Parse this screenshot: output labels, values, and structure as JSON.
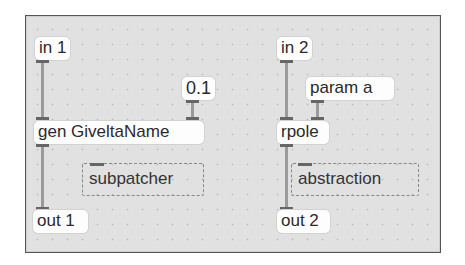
{
  "patcher": {
    "background_color": "#e1e1e1",
    "objects": {
      "in1": {
        "label": "in 1"
      },
      "num": {
        "label": "0.1"
      },
      "gen": {
        "label": "gen GiveltaName"
      },
      "subpatcher": {
        "label": "subpatcher"
      },
      "out1": {
        "label": "out 1"
      },
      "in2": {
        "label": "in 2"
      },
      "param": {
        "label": "param a"
      },
      "rpole": {
        "label": "rpole"
      },
      "abstraction": {
        "label": "abstraction"
      },
      "out2": {
        "label": "out 2"
      }
    },
    "connections": [
      {
        "from": "in 1",
        "to": "gen GiveltaName"
      },
      {
        "from": "0.1",
        "to": "gen GiveltaName"
      },
      {
        "from": "gen GiveltaName",
        "to": "out 1"
      },
      {
        "from": "in 2",
        "to": "rpole"
      },
      {
        "from": "param a",
        "to": "rpole"
      },
      {
        "from": "rpole",
        "to": "out 2"
      }
    ]
  }
}
